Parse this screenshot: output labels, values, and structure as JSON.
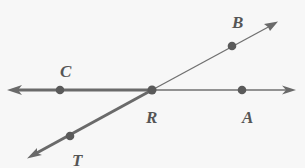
{
  "diagram": {
    "type": "geometry-rays",
    "colors": {
      "line": "#6e6e6e",
      "bold": "#6a6a6a",
      "point": "#5a5a5a",
      "label": "#555555",
      "background": "#f7f7f7"
    },
    "points": [
      {
        "id": "C",
        "label": "C",
        "x": 60,
        "y": 90
      },
      {
        "id": "R",
        "label": "R",
        "x": 152,
        "y": 90
      },
      {
        "id": "A",
        "label": "A",
        "x": 242,
        "y": 90
      },
      {
        "id": "B",
        "label": "B",
        "x": 232,
        "y": 46
      },
      {
        "id": "T",
        "label": "T",
        "x": 70,
        "y": 136
      }
    ],
    "rays": [
      {
        "from": "R",
        "through": "C",
        "bold": true
      },
      {
        "from": "R",
        "through": "A",
        "bold": false
      },
      {
        "from": "R",
        "through": "B",
        "bold": false
      },
      {
        "from": "R",
        "through": "T",
        "bold": true
      }
    ]
  }
}
